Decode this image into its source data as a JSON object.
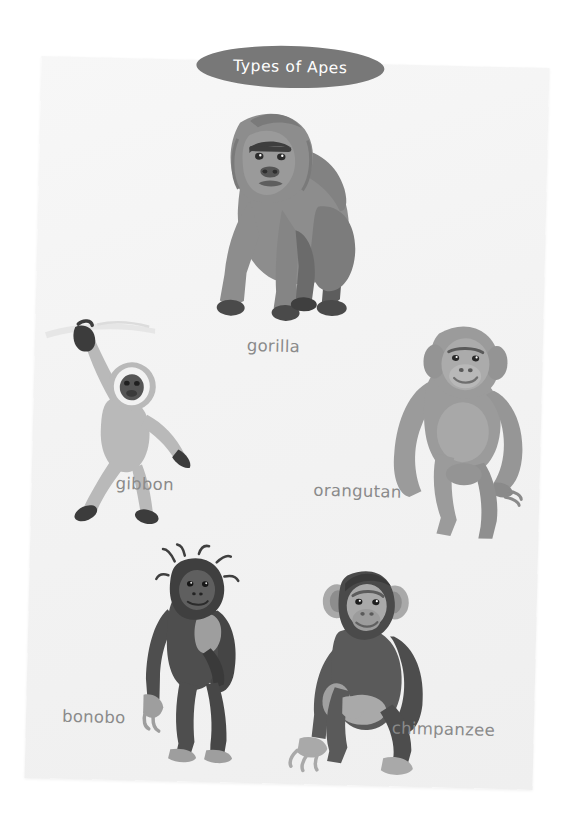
{
  "poster": {
    "title": "Types of Apes",
    "title_bg_color": "#787878",
    "title_text_color": "#ffffff",
    "page_bg_color": "#f4f4f4",
    "canvas_bg_color": "#ffffff",
    "label_color": "#8a8a8a"
  },
  "apes": [
    {
      "id": "gorilla",
      "label": "gorilla",
      "fur_color": "#8d8d8d",
      "shadow_color": "#6f6f6f",
      "dark_color": "#4a4a4a",
      "face_color": "#9a9a9a"
    },
    {
      "id": "gibbon",
      "label": "gibbon",
      "fur_color": "#b9b9b9",
      "shadow_color": "#a6a6a6",
      "dark_color": "#3c3c3c",
      "face_color": "#eeeeee"
    },
    {
      "id": "orangutan",
      "label": "orangutan",
      "fur_color": "#9b9b9b",
      "shadow_color": "#868686",
      "dark_color": "#5a5a5a",
      "face_color": "#ababab"
    },
    {
      "id": "bonobo",
      "label": "bonobo",
      "fur_color": "#4e4e4e",
      "shadow_color": "#3a3a3a",
      "dark_color": "#2b2b2b",
      "face_color": "#9e9e9e"
    },
    {
      "id": "chimpanzee",
      "label": "chimpanzee",
      "fur_color": "#5a5a5a",
      "shadow_color": "#454545",
      "dark_color": "#303030",
      "face_color": "#a9a9a9"
    }
  ]
}
